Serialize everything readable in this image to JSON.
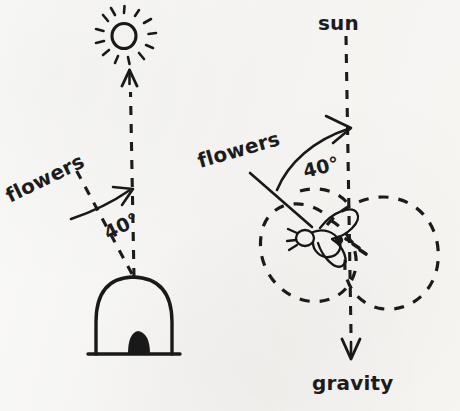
{
  "figure": {
    "background_color": "#f7f6f4",
    "ink_color": "#191919",
    "width": 460,
    "height": 411
  },
  "left_panel": {
    "name": "field-geometry-outside-hive",
    "sun_icon_label": "sun-symbol",
    "hive_label": "beehive",
    "flowers_label": "flowers",
    "angle_label": "40°",
    "angle_value": 40,
    "angle_unit": "degrees",
    "reference_direction": "sun",
    "target_direction": "flowers",
    "description": "Outside the hive the bee sees the flowers 40 degrees to the left of the sun direction."
  },
  "right_panel": {
    "name": "dance-geometry-inside-hive",
    "sun_label": "sun",
    "gravity_label": "gravity",
    "flowers_label": "flowers",
    "angle_label": "40°",
    "angle_value": 40,
    "angle_unit": "degrees",
    "dancer_label": "bee",
    "dance_path_label": "figure-eight waggle dance path",
    "reference_direction": "gravity (upward = sun)",
    "target_direction": "flowers",
    "description": "Inside the dark hive the vertical up direction represents the sun; the waggle run is 40 degrees from vertical."
  }
}
